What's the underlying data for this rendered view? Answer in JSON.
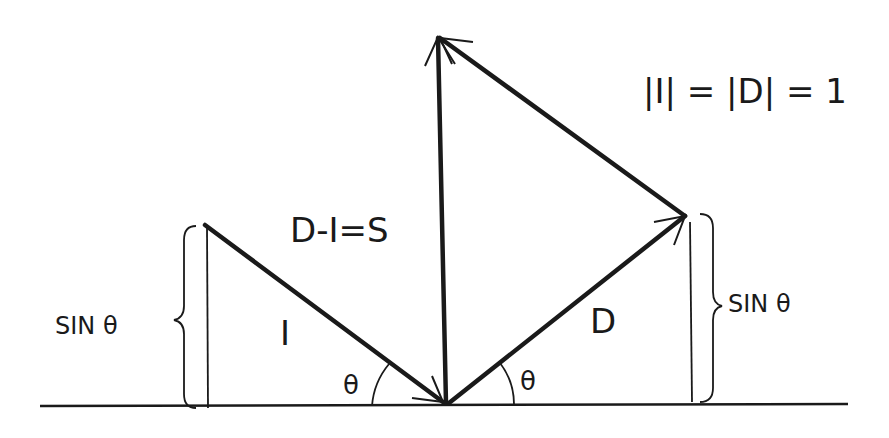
{
  "diagram": {
    "labels": {
      "equation_main": "D-I=S",
      "equation_norm": "|I| = |D| = 1",
      "norm_part1": "|I|",
      "norm_eq1": "=",
      "norm_part2": "|D|",
      "norm_eq2": "= 1",
      "vector_I": "I",
      "vector_D": "D",
      "sin_left": "SIN θ",
      "sin_right": "SIN θ",
      "theta_left": "θ",
      "theta_right": "θ"
    },
    "vectors": [
      {
        "name": "I",
        "from": [
          205,
          225
        ],
        "to": [
          443,
          402
        ]
      },
      {
        "name": "D",
        "from": [
          448,
          404
        ],
        "to": [
          685,
          215
        ]
      },
      {
        "name": "S",
        "from": [
          445,
          404
        ],
        "to": [
          437,
          37
        ]
      },
      {
        "name": "-I (translated)",
        "from": [
          685,
          215
        ],
        "to": [
          437,
          37
        ]
      }
    ],
    "colors": {
      "ink": "#1a1a1a",
      "background": "#ffffff"
    }
  }
}
